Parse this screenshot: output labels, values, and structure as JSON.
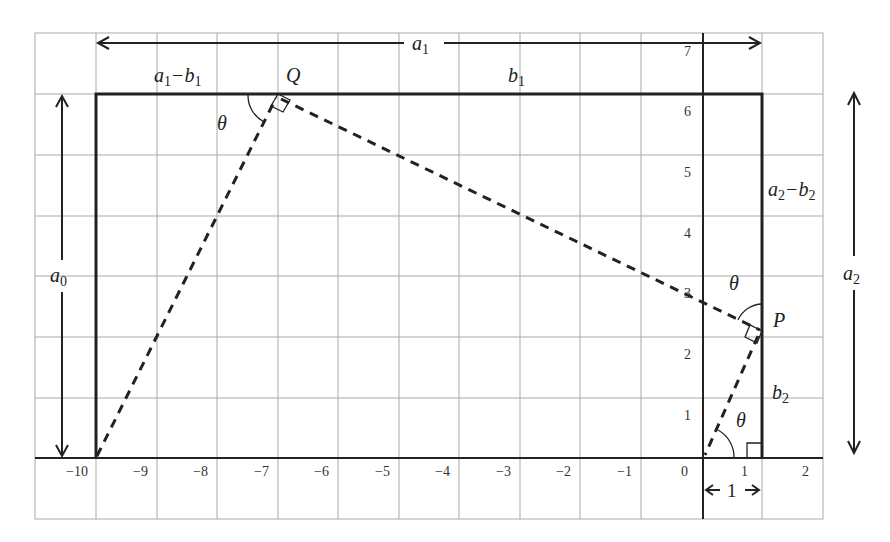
{
  "diagram": {
    "grid": {
      "x_ticks": [
        "−10",
        "−9",
        "−8",
        "−7",
        "−6",
        "−5",
        "−4",
        "−3",
        "−2",
        "−1",
        "0",
        "1",
        "2"
      ],
      "y_ticks": [
        "1",
        "2",
        "3",
        "4",
        "5",
        "6",
        "7"
      ]
    },
    "points": {
      "Q": "Q",
      "P": "P"
    },
    "segment_labels": {
      "a1": "a",
      "a1_sub": "1",
      "a1_minus_b1": "a",
      "a1_minus_b1_sub1": "1",
      "a1_minus_b1_op": "−b",
      "a1_minus_b1_sub2": "1",
      "b1": "b",
      "b1_sub": "1",
      "a0": "a",
      "a0_sub": "0",
      "a2": "a",
      "a2_sub": "2",
      "a2_minus_b2": "a",
      "a2_minus_b2_sub1": "2",
      "a2_minus_b2_op": "−b",
      "a2_minus_b2_sub2": "2",
      "b2": "b",
      "b2_sub": "2",
      "unit": "1"
    },
    "angles": {
      "theta_Q": "θ",
      "theta_P": "θ",
      "theta_O": "θ"
    },
    "colors": {
      "line": "#222222",
      "grid": "#a9a9a9",
      "background": "#ffffff"
    }
  }
}
